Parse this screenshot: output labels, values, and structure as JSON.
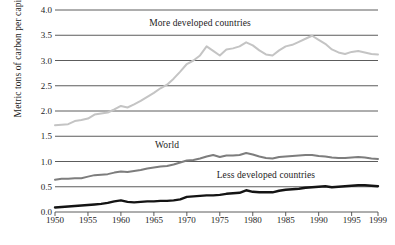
{
  "chart_data": {
    "type": "line",
    "title": "",
    "xlabel": "",
    "ylabel": "Metric tons of carbon per capita",
    "xlim": [
      1950,
      1999
    ],
    "ylim": [
      0.0,
      4.0
    ],
    "grid": true,
    "legend_position": "inline-annotations",
    "xticks": [
      "1950",
      "1955",
      "1960",
      "1965",
      "1970",
      "1975",
      "1980",
      "1985",
      "1990",
      "1995",
      "1999"
    ],
    "xtick_values": [
      1950,
      1955,
      1960,
      1965,
      1970,
      1975,
      1980,
      1985,
      1990,
      1995,
      1999
    ],
    "yticks": [
      "0.0",
      "0.5",
      "1.0",
      "1.5",
      "2.0",
      "2.5",
      "3.0",
      "3.5",
      "4.0"
    ],
    "ytick_values": [
      0.0,
      0.5,
      1.0,
      1.5,
      2.0,
      2.5,
      3.0,
      3.5,
      4.0
    ],
    "x": [
      1950,
      1951,
      1952,
      1953,
      1954,
      1955,
      1956,
      1957,
      1958,
      1959,
      1960,
      1961,
      1962,
      1963,
      1964,
      1965,
      1966,
      1967,
      1968,
      1969,
      1970,
      1971,
      1972,
      1973,
      1974,
      1975,
      1976,
      1977,
      1978,
      1979,
      1980,
      1981,
      1982,
      1983,
      1984,
      1985,
      1986,
      1987,
      1988,
      1989,
      1990,
      1991,
      1992,
      1993,
      1994,
      1995,
      1996,
      1997,
      1998,
      1999
    ],
    "series": [
      {
        "name": "More developed countries",
        "color": "#c4c4c4",
        "label_x": 1972,
        "label_y": 3.72,
        "values": [
          1.72,
          1.73,
          1.74,
          1.8,
          1.82,
          1.85,
          1.93,
          1.95,
          1.97,
          2.03,
          2.1,
          2.07,
          2.13,
          2.2,
          2.28,
          2.36,
          2.45,
          2.52,
          2.64,
          2.78,
          2.93,
          3.0,
          3.1,
          3.28,
          3.19,
          3.1,
          3.22,
          3.24,
          3.28,
          3.36,
          3.3,
          3.2,
          3.12,
          3.1,
          3.2,
          3.28,
          3.31,
          3.37,
          3.43,
          3.49,
          3.41,
          3.33,
          3.22,
          3.16,
          3.13,
          3.17,
          3.19,
          3.16,
          3.13,
          3.12
        ]
      },
      {
        "name": "World",
        "color": "#7d7d7d",
        "label_x": 1967,
        "label_y": 1.3,
        "values": [
          0.64,
          0.66,
          0.66,
          0.67,
          0.67,
          0.7,
          0.73,
          0.74,
          0.75,
          0.78,
          0.8,
          0.79,
          0.81,
          0.83,
          0.86,
          0.88,
          0.9,
          0.91,
          0.94,
          0.98,
          1.02,
          1.03,
          1.06,
          1.1,
          1.13,
          1.09,
          1.12,
          1.12,
          1.13,
          1.17,
          1.14,
          1.1,
          1.07,
          1.06,
          1.09,
          1.1,
          1.11,
          1.12,
          1.13,
          1.13,
          1.11,
          1.1,
          1.08,
          1.07,
          1.07,
          1.08,
          1.09,
          1.08,
          1.06,
          1.05
        ]
      },
      {
        "name": "Less developed countries",
        "color": "#141414",
        "label_x": 1982,
        "label_y": 0.72,
        "values": [
          0.09,
          0.1,
          0.11,
          0.12,
          0.13,
          0.14,
          0.15,
          0.16,
          0.18,
          0.21,
          0.23,
          0.2,
          0.19,
          0.2,
          0.21,
          0.21,
          0.22,
          0.22,
          0.23,
          0.25,
          0.3,
          0.31,
          0.32,
          0.33,
          0.33,
          0.34,
          0.36,
          0.37,
          0.38,
          0.43,
          0.4,
          0.39,
          0.39,
          0.39,
          0.42,
          0.44,
          0.45,
          0.46,
          0.48,
          0.49,
          0.5,
          0.51,
          0.49,
          0.5,
          0.51,
          0.52,
          0.53,
          0.53,
          0.52,
          0.51
        ]
      }
    ]
  },
  "caption": ""
}
